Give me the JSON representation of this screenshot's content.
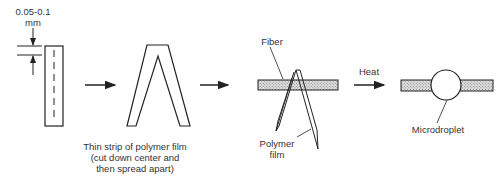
{
  "diagram": {
    "thickness_label_line1": "0.05-0.1",
    "thickness_label_line2": "mm",
    "step1_caption_line1": "Thin strip of polymer film",
    "step1_caption_line2": "(cut down center and",
    "step1_caption_line3": "then spread apart)",
    "fiber_label": "Fiber",
    "polymer_film_line1": "Polymer",
    "polymer_film_line2": "film",
    "heat_label": "Heat",
    "microdroplet_label": "Microdroplet"
  }
}
